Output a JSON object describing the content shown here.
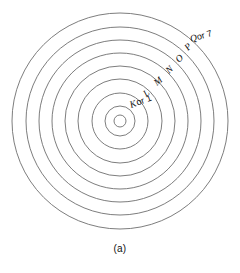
{
  "figure": {
    "caption": "(a)",
    "type": "atomic-shell-diagram",
    "center": {
      "x": 120,
      "y": 121
    },
    "stroke_color": "#6e6e6e",
    "background_color": "#ffffff",
    "text_color": "#111111",
    "rings": [
      {
        "index": 0,
        "radius": 6,
        "name": "nucleus"
      },
      {
        "index": 1,
        "radius": 15,
        "name": "shell-k"
      },
      {
        "index": 2,
        "radius": 28,
        "name": "shell-l"
      },
      {
        "index": 3,
        "radius": 42,
        "name": "shell-m"
      },
      {
        "index": 4,
        "radius": 55,
        "name": "shell-n"
      },
      {
        "index": 5,
        "radius": 68,
        "name": "shell-o"
      },
      {
        "index": 6,
        "radius": 81,
        "name": "shell-p"
      },
      {
        "index": 7,
        "radius": 94,
        "name": "shell-q"
      },
      {
        "index": 8,
        "radius": 108,
        "name": "shell-outer"
      }
    ],
    "labels": [
      {
        "id": "k",
        "text": "K",
        "suffix": " or 1",
        "x": 131,
        "y": 108,
        "rotation": -20
      },
      {
        "id": "l",
        "text": "L",
        "suffix": "",
        "x": 146,
        "y": 97,
        "rotation": -38
      },
      {
        "id": "m",
        "text": "M",
        "suffix": "",
        "x": 159,
        "y": 86,
        "rotation": -40
      },
      {
        "id": "n",
        "text": "N",
        "suffix": "",
        "x": 170,
        "y": 74,
        "rotation": -42
      },
      {
        "id": "o",
        "text": "O",
        "suffix": "",
        "x": 180,
        "y": 63,
        "rotation": -45
      },
      {
        "id": "p",
        "text": "P",
        "suffix": "",
        "x": 189,
        "y": 50,
        "rotation": -45
      },
      {
        "id": "q",
        "text": "Q",
        "suffix": " or 7",
        "x": 197,
        "y": 42,
        "rotation": -18
      }
    ]
  }
}
